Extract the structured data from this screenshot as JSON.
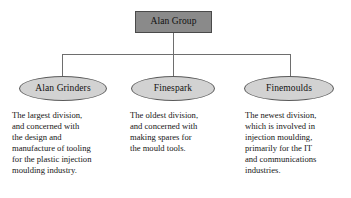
{
  "diagram": {
    "type": "organisation-chart",
    "colors": {
      "root_fill": "#8a8a8a",
      "root_stroke": "#4a4a4a",
      "node_fill": "#d2d2d2",
      "node_stroke": "#5a5a5a",
      "connector": "#6e6e6e",
      "background": "#ffffff",
      "text": "#161616"
    },
    "root": {
      "label": "Alan Group",
      "shape": "rectangle"
    },
    "divisions": [
      {
        "label": "Alan Grinders",
        "shape": "ellipse",
        "description": "The largest division, and concerned with the design and manufacture of tooling for the plastic injection moulding industry.",
        "description_lines": [
          "The largest division,",
          "and concerned with",
          "the design and",
          "manufacture of tooling",
          "for the plastic injection",
          "moulding industry."
        ]
      },
      {
        "label": "Finespark",
        "shape": "ellipse",
        "description": "The oldest division, and concerned with making spares for the mould tools.",
        "description_lines": [
          "The oldest division,",
          "and concerned with",
          "making spares for",
          "the mould tools."
        ]
      },
      {
        "label": "Finemoulds",
        "shape": "ellipse",
        "description": "The newest division, which is involved in injection moulding, primarily for the IT and communications industries.",
        "description_lines": [
          "The newest division,",
          "which is involved in",
          "injection moulding,",
          "primarily for the IT",
          "and communications",
          "industries."
        ]
      }
    ]
  }
}
